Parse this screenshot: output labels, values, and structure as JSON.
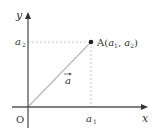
{
  "diagram": {
    "axes": {
      "x_label": "x",
      "y_label": "y",
      "origin_label": "O"
    },
    "point": {
      "label": "A",
      "coords_text": "(a₁, a₂)",
      "name": "A",
      "x_symbol": "a",
      "x_sub": "1",
      "y_symbol": "a",
      "y_sub": "2"
    },
    "ticks": {
      "x_tick_symbol": "a",
      "x_tick_sub": "1",
      "y_tick_symbol": "a",
      "y_tick_sub": "2"
    },
    "vector": {
      "label": "a",
      "arrow": "→"
    },
    "colors": {
      "axis": "#555555",
      "vector": "#bbbbbb",
      "dashed": "#cccccc",
      "point": "#222222",
      "text": "#333333"
    }
  }
}
